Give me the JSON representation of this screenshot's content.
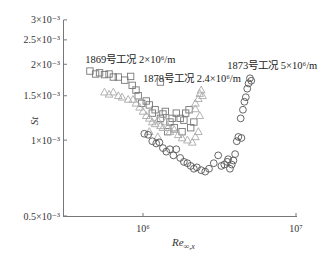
{
  "chart_data": {
    "type": "scatter",
    "title": "",
    "xlabel": "Re∞,x",
    "ylabel": "St",
    "xscale": "log",
    "yscale": "log",
    "xlim": [
      300000,
      10000000
    ],
    "ylim": [
      0.0005,
      0.0031
    ],
    "x_ticks": [
      {
        "value": 1000000,
        "label": "10⁶"
      },
      {
        "value": 10000000,
        "label": "10⁷"
      }
    ],
    "y_ticks": [
      {
        "value": 0.003,
        "label": "3×10⁻³"
      },
      {
        "value": 0.0025,
        "label": "2.5×10⁻³"
      },
      {
        "value": 0.002,
        "label": "2×10⁻³"
      },
      {
        "value": 0.0015,
        "label": "1.5×10⁻³"
      },
      {
        "value": 0.001,
        "label": "1×10⁻³"
      },
      {
        "value": 0.0005,
        "label": "0.5×10⁻³"
      }
    ],
    "grid": false,
    "legend": "inline annotations",
    "series": [
      {
        "name": "1869号工况 2×10⁶/m",
        "marker": "square",
        "points": [
          [
            450000,
            0.00188
          ],
          [
            490000,
            0.00183
          ],
          [
            520000,
            0.00185
          ],
          [
            560000,
            0.00182
          ],
          [
            600000,
            0.00183
          ],
          [
            640000,
            0.00178
          ],
          [
            690000,
            0.00178
          ],
          [
            760000,
            0.00173
          ],
          [
            830000,
            0.00179
          ],
          [
            850000,
            0.00165
          ],
          [
            900000,
            0.00158
          ],
          [
            930000,
            0.0015
          ],
          [
            980000,
            0.0014
          ],
          [
            1050000,
            0.00143
          ],
          [
            1100000,
            0.00138
          ],
          [
            1150000,
            0.00128
          ],
          [
            1200000,
            0.00132
          ],
          [
            1300000,
            0.00122
          ],
          [
            1350000,
            0.00127
          ],
          [
            1400000,
            0.0013
          ],
          [
            1500000,
            0.00118
          ],
          [
            1550000,
            0.00122
          ],
          [
            1650000,
            0.00128
          ],
          [
            1750000,
            0.00122
          ],
          [
            1850000,
            0.0012
          ],
          [
            1900000,
            0.00128
          ],
          [
            2000000,
            0.00132
          ],
          [
            1300000,
            0.0017
          ],
          [
            2150000,
            0.00118
          ],
          [
            1600000,
            0.00112
          ],
          [
            1450000,
            0.00108
          ],
          [
            1800000,
            0.00108
          ],
          [
            2050000,
            0.00112
          ]
        ]
      },
      {
        "name": "1878号工况 2.4×10⁶/m",
        "marker": "triangle",
        "points": [
          [
            560000,
            0.00155
          ],
          [
            600000,
            0.00152
          ],
          [
            640000,
            0.00155
          ],
          [
            690000,
            0.0015
          ],
          [
            730000,
            0.00148
          ],
          [
            800000,
            0.00145
          ],
          [
            860000,
            0.00145
          ],
          [
            900000,
            0.0014
          ],
          [
            950000,
            0.00135
          ],
          [
            1000000,
            0.0013
          ],
          [
            1050000,
            0.00125
          ],
          [
            1100000,
            0.00122
          ],
          [
            1150000,
            0.00118
          ],
          [
            1200000,
            0.00116
          ],
          [
            1250000,
            0.0012
          ],
          [
            1300000,
            0.00114
          ],
          [
            1350000,
            0.00112
          ],
          [
            1400000,
            0.00118
          ],
          [
            1450000,
            0.00112
          ],
          [
            1500000,
            0.00108
          ],
          [
            1600000,
            0.0011
          ],
          [
            1700000,
            0.00105
          ],
          [
            1800000,
            0.00102
          ],
          [
            1950000,
            0.001
          ],
          [
            2100000,
            0.00098
          ],
          [
            2200000,
            0.00103
          ],
          [
            2300000,
            0.00108
          ],
          [
            2200000,
            0.0014
          ],
          [
            2300000,
            0.00146
          ],
          [
            2350000,
            0.00153
          ],
          [
            2400000,
            0.00158
          ],
          [
            2450000,
            0.0015
          ],
          [
            2200000,
            0.00133
          ],
          [
            2350000,
            0.00125
          ],
          [
            1100000,
            0.00108
          ],
          [
            1250000,
            0.00103
          ]
        ]
      },
      {
        "name": "1873号工况 5×10⁶/m",
        "marker": "circle",
        "points": [
          [
            1020000,
            0.00106
          ],
          [
            1080000,
            0.00105
          ],
          [
            1150000,
            0.00099
          ],
          [
            1220000,
            0.00097
          ],
          [
            1280000,
            0.00098
          ],
          [
            1350000,
            0.00093
          ],
          [
            1420000,
            0.0009
          ],
          [
            1500000,
            0.00092
          ],
          [
            1580000,
            0.00087
          ],
          [
            1650000,
            0.00092
          ],
          [
            1750000,
            0.00085
          ],
          [
            1850000,
            0.00082
          ],
          [
            1950000,
            0.00081
          ],
          [
            2050000,
            0.00079
          ],
          [
            2150000,
            0.00077
          ],
          [
            2250000,
            0.00078
          ],
          [
            2400000,
            0.00076
          ],
          [
            2550000,
            0.00075
          ],
          [
            2700000,
            0.00077
          ],
          [
            2900000,
            0.00081
          ],
          [
            3100000,
            0.00087
          ],
          [
            3250000,
            0.00079
          ],
          [
            3400000,
            0.0008
          ],
          [
            3550000,
            0.00082
          ],
          [
            3700000,
            0.00077
          ],
          [
            3800000,
            0.0008
          ],
          [
            3900000,
            0.00083
          ],
          [
            4000000,
            0.00088
          ],
          [
            4100000,
            0.00099
          ],
          [
            4200000,
            0.00103
          ],
          [
            4350000,
            0.00122
          ],
          [
            4500000,
            0.00132
          ],
          [
            4600000,
            0.00142
          ],
          [
            4700000,
            0.00148
          ],
          [
            4800000,
            0.0016
          ],
          [
            4900000,
            0.00168
          ],
          [
            5000000,
            0.00176
          ],
          [
            5100000,
            0.00172
          ],
          [
            4400000,
            0.00102
          ],
          [
            3600000,
            0.00084
          ]
        ]
      }
    ],
    "annotations": [
      {
        "text": "1869号工况 2×10⁶/m",
        "x": 420000,
        "y": 0.00203
      },
      {
        "text": "1878号工况 2.4×10⁶/m",
        "x": 1000000,
        "y": 0.0017
      },
      {
        "text": "1873号工况 5×10⁶/m",
        "x": 3550000,
        "y": 0.00192
      }
    ]
  },
  "axis_labels": {
    "x": "Re",
    "x_sub": "∞,x",
    "y": "St"
  }
}
